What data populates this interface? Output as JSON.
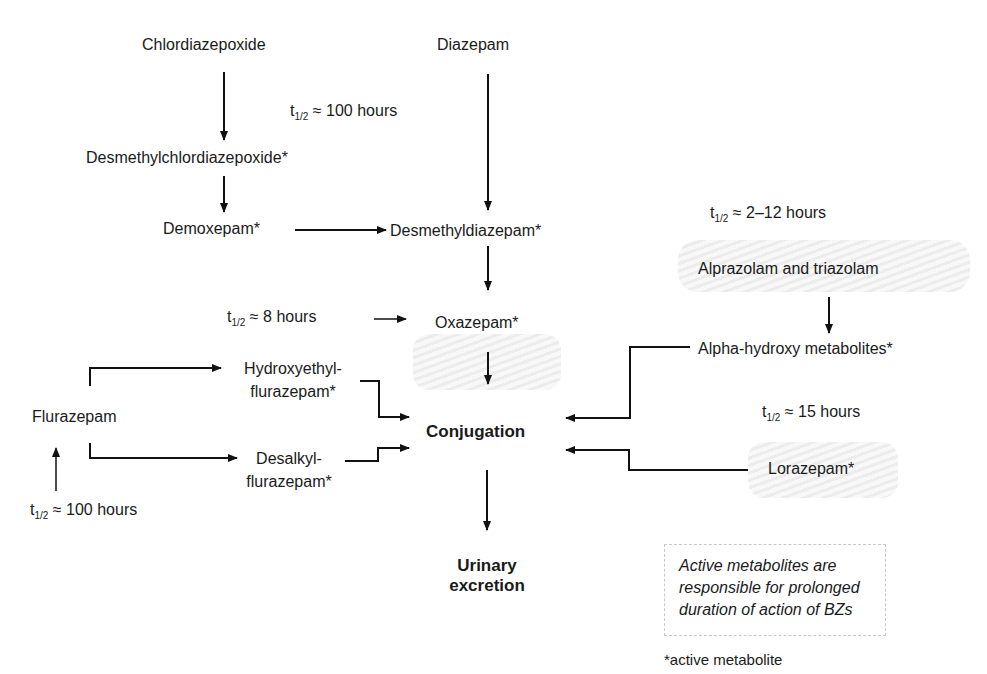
{
  "diagram": {
    "nodes": {
      "chlordiazepoxide": "Chlordiazepoxide",
      "diazepam": "Diazepam",
      "desmethylchlordiazepoxide": "Desmethylchlordiazepoxide*",
      "demoxepam": "Demoxepam*",
      "desmethyldiazepam": "Desmethyldiazepam*",
      "oxazepam": "Oxazepam*",
      "alprazolam_triazolam": "Alprazolam and triazolam",
      "alpha_hydroxy": "Alpha-hydroxy metabolites*",
      "flurazepam": "Flurazepam",
      "hydroxyethyl_line1": "Hydroxyethyl-",
      "hydroxyethyl_line2": "flurazepam*",
      "desalkyl_line1": "Desalkyl-",
      "desalkyl_line2": "flurazepam*",
      "conjugation": "Conjugation",
      "lorazepam": "Lorazepam*",
      "urinary_line1": "Urinary",
      "urinary_line2": "excretion"
    },
    "half_lives": {
      "symbol": "t",
      "subscript": "1/2",
      "approx": "≈",
      "diazepam": "100 hours",
      "oxazepam": "8 hours",
      "alprazolam": "2–12 hours",
      "lorazepam": "15 hours",
      "flurazepam": "100 hours"
    },
    "note": {
      "line1": "Active metabolites are",
      "line2": "responsible for prolonged",
      "line3": "duration of action of BZs"
    },
    "footnote": "*active metabolite"
  }
}
